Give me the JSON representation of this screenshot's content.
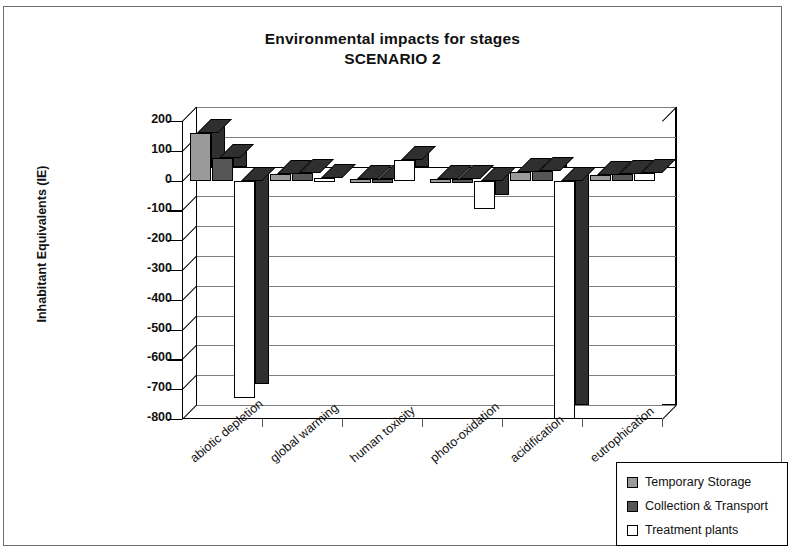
{
  "chart_data": {
    "type": "bar",
    "title": "Environmental impacts for stages",
    "subtitle": "SCENARIO 2",
    "xlabel": "",
    "ylabel": "Inhabitant Equivalents (IE)",
    "ylim": [
      -800,
      200
    ],
    "ytick_step": 100,
    "yticks": [
      "200",
      "100",
      "0",
      "-100",
      "-200",
      "-300",
      "-400",
      "-500",
      "-600",
      "-700",
      "-800"
    ],
    "ytick_values": [
      200,
      100,
      0,
      -100,
      -200,
      -300,
      -400,
      -500,
      -600,
      -700,
      -800
    ],
    "grid": true,
    "legend_position": "bottom-right",
    "categories": [
      "abiotic depletion",
      "global warming",
      "human toxicity",
      "photo-oxidation",
      "acidification",
      "eutrophication"
    ],
    "series": [
      {
        "name": "Temporary Storage",
        "color": "#9a9a9a",
        "values": [
          160,
          22,
          5,
          5,
          30,
          20
        ]
      },
      {
        "name": "Collection & Transport",
        "color": "#565656",
        "values": [
          75,
          25,
          5,
          5,
          32,
          22
        ]
      },
      {
        "name": "Treatment plants",
        "color": "#ffffff",
        "values": [
          -730,
          8,
          68,
          -95,
          -800,
          25
        ]
      }
    ]
  },
  "legend": {
    "items": [
      {
        "label": "Temporary Storage",
        "color": "#9a9a9a"
      },
      {
        "label": "Collection & Transport",
        "color": "#565656"
      },
      {
        "label": "Treatment plants",
        "color": "#ffffff"
      }
    ]
  }
}
